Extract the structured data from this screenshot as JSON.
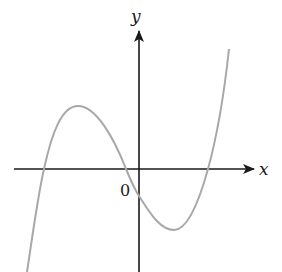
{
  "figure": {
    "type": "function-graph",
    "colors": {
      "axes": "#1a1a1a",
      "curve": "#a8a8a8",
      "background": "#ffffff"
    }
  },
  "axes": {
    "x_label": "x",
    "y_label": "y",
    "origin_label": "0"
  },
  "curve": {
    "kind": "cubic",
    "roots": "three real roots: one far left, one just left of origin, one to the right",
    "local_max": "left of origin, above x-axis",
    "local_min": "right of origin, below x-axis",
    "y_intercept": "negative"
  }
}
